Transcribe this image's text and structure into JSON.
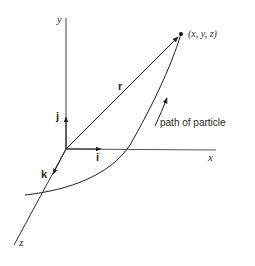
{
  "diagram": {
    "axes": {
      "x_label": "x",
      "y_label": "y",
      "z_label": "z"
    },
    "unit_vectors": {
      "i": "i",
      "j": "j",
      "k": "k"
    },
    "position_vector_label": "r",
    "point_label": "(x, y, z)",
    "path_label": "path of particle",
    "colors": {
      "line": "#333333",
      "background": "#ffffff"
    }
  }
}
